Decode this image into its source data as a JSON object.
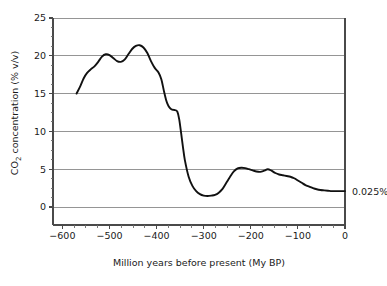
{
  "chart_data": {
    "type": "line",
    "title": "",
    "xlabel": "Million years before present (My BP)",
    "ylabel": "CO2 concentration (% v/v)",
    "ylabel_parts": {
      "prefix": "CO",
      "subscript": "2",
      "suffix": " concentration (% v/v)"
    },
    "xlim": [
      -620,
      0
    ],
    "ylim": [
      0,
      25
    ],
    "grid": true,
    "grid_axis": "y",
    "legend": false,
    "legend_position": "none",
    "x_ticks": [
      -600,
      -500,
      -400,
      -300,
      -200,
      -100,
      0
    ],
    "x_tick_labels": [
      "−600",
      "−500",
      "−400",
      "−300",
      "−200",
      "−100",
      "0"
    ],
    "x_minor_tick_step": 25,
    "y_ticks": [
      0,
      5,
      10,
      15,
      20,
      25
    ],
    "y_tick_labels": [
      "0",
      "5",
      "10",
      "15",
      "20",
      "25"
    ],
    "y_minor_tick_step": 1.25,
    "series": [
      {
        "name": "CO2 concentration",
        "color": "#111111",
        "x": [
          -570,
          -562,
          -555,
          -548,
          -540,
          -532,
          -524,
          -516,
          -508,
          -500,
          -492,
          -484,
          -476,
          -468,
          -460,
          -452,
          -444,
          -436,
          -428,
          -420,
          -412,
          -404,
          -396,
          -390,
          -384,
          -380,
          -376,
          -372,
          -368,
          -364,
          -360,
          -356,
          -352,
          -348,
          -344,
          -340,
          -332,
          -324,
          -316,
          -308,
          -300,
          -292,
          -284,
          -276,
          -268,
          -260,
          -252,
          -244,
          -236,
          -228,
          -220,
          -212,
          -204,
          -196,
          -188,
          -180,
          -172,
          -164,
          -156,
          -148,
          -140,
          -132,
          -124,
          -116,
          -108,
          -100,
          -92,
          -84,
          -76,
          -68,
          -60,
          -52,
          -44,
          -36,
          -28,
          -20,
          -12,
          -6,
          0
        ],
        "y": [
          15.0,
          16.0,
          17.0,
          17.7,
          18.2,
          18.6,
          19.2,
          19.9,
          20.2,
          20.1,
          19.7,
          19.3,
          19.2,
          19.5,
          20.2,
          20.9,
          21.3,
          21.4,
          21.1,
          20.4,
          19.3,
          18.4,
          17.8,
          16.9,
          15.2,
          14.2,
          13.5,
          13.1,
          12.9,
          12.85,
          12.8,
          12.6,
          11.6,
          9.8,
          7.9,
          6.2,
          4.0,
          2.8,
          2.1,
          1.7,
          1.5,
          1.45,
          1.5,
          1.6,
          1.9,
          2.4,
          3.2,
          4.0,
          4.7,
          5.1,
          5.2,
          5.15,
          5.0,
          4.85,
          4.7,
          4.65,
          4.8,
          5.0,
          4.8,
          4.5,
          4.3,
          4.2,
          4.1,
          4.0,
          3.8,
          3.5,
          3.2,
          2.9,
          2.7,
          2.5,
          2.35,
          2.25,
          2.2,
          2.15,
          2.1,
          2.1,
          2.1,
          2.1,
          2.1
        ]
      }
    ],
    "annotations": [
      {
        "name": "present-day-value",
        "text": "0.025%",
        "x": 0,
        "y": 2.1,
        "placement": "right-of-axis"
      }
    ],
    "features": [
      {
        "label": "first Cambrian peak",
        "x": -508,
        "y": 20.2
      },
      {
        "label": "saddle",
        "x": -476,
        "y": 19.2
      },
      {
        "label": "second peak (maximum)",
        "x": -436,
        "y": 21.4
      },
      {
        "label": "Carboniferous shoulder",
        "x": -360,
        "y": 12.8
      },
      {
        "label": "Permian minimum",
        "x": -292,
        "y": 1.45
      },
      {
        "label": "Jurassic plateau",
        "x": -220,
        "y": 5.2
      },
      {
        "label": "Cretaceous bump",
        "x": -164,
        "y": 5.0
      },
      {
        "label": "present day",
        "x": 0,
        "y": 2.1
      }
    ]
  },
  "colors": {
    "curve": "#111111",
    "gridline": "#8a8a8a",
    "spine": "#4a4a4a",
    "text": "#1a1a1a",
    "background": "#ffffff"
  }
}
